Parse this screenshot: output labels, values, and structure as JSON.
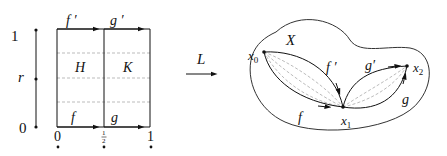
{
  "left_panel": {
    "parameter_axis": {
      "label": "r",
      "top_label": "1",
      "bottom_label": "0"
    },
    "square": {
      "top_labels": [
        "f ′",
        "g ′"
      ],
      "bottom_labels": [
        "f",
        "g"
      ],
      "region_labels": [
        "H",
        "K"
      ],
      "x_tick_labels": [
        "0",
        "1/2",
        "1"
      ],
      "half_numerator": "1",
      "half_denominator": "2"
    }
  },
  "map_arrow": {
    "label": "L"
  },
  "right_panel": {
    "space_label": "X",
    "points": {
      "x0": {
        "base": "x",
        "sub": "0"
      },
      "x1": {
        "base": "x",
        "sub": "1"
      },
      "x2": {
        "base": "x",
        "sub": "2"
      }
    },
    "path_labels": {
      "f": "f",
      "f_prime": "f ′",
      "g": "g",
      "g_prime": "g′"
    }
  },
  "colors": {
    "line": "#111111",
    "dashed": "#aaaaaa",
    "outline": "#333333"
  }
}
